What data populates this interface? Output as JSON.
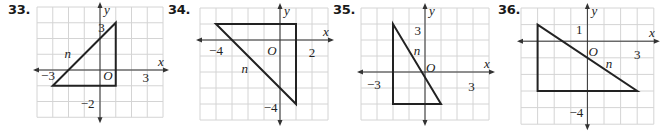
{
  "colors": {
    "grid": "#d4d4d4",
    "axis": "#333333",
    "triangle": "#222222",
    "text": "#222222"
  },
  "problems": [
    {
      "number": "33.",
      "num_x": 8,
      "grid": {
        "left": 37,
        "top": 7,
        "cell": 15.75,
        "xmin": -4,
        "xmax": 4,
        "ymin": -3,
        "ymax": 4
      },
      "triangle": [
        [
          -3,
          -1
        ],
        [
          1,
          -1
        ],
        [
          1,
          3
        ]
      ],
      "hypotenuse_label": {
        "text": "n",
        "x": -2.05,
        "y": 1.0
      },
      "axis_labels": {
        "x": "x",
        "y": "y",
        "origin": "O"
      },
      "ticks": [
        {
          "text": "3",
          "x": 0.3,
          "y": 2.7,
          "anchor": "end"
        },
        {
          "text": "−3",
          "x": -3.3,
          "y": -0.3,
          "anchor": "middle"
        },
        {
          "text": "3",
          "x": 2.9,
          "y": -0.45,
          "anchor": "middle"
        },
        {
          "text": "−2",
          "x": -0.35,
          "y": -2.1,
          "anchor": "end"
        }
      ],
      "origin_pos": {
        "x": 0.5,
        "y": -0.3
      }
    },
    {
      "number": "34.",
      "num_x": 168,
      "grid": {
        "left": 200,
        "top": 8,
        "cell": 16,
        "xmin": -5,
        "xmax": 3,
        "ymin": -5,
        "ymax": 2
      },
      "triangle": [
        [
          -4,
          1
        ],
        [
          1,
          1
        ],
        [
          1,
          -4
        ]
      ],
      "hypotenuse_label": {
        "text": "n",
        "x": -2.2,
        "y": -1.8
      },
      "axis_labels": {
        "x": "x",
        "y": "y",
        "origin": "O"
      },
      "ticks": [
        {
          "text": "−4",
          "x": -4.0,
          "y": -0.6,
          "anchor": "middle"
        },
        {
          "text": "2",
          "x": 2.0,
          "y": -0.75,
          "anchor": "middle"
        },
        {
          "text": "−4",
          "x": -0.15,
          "y": -4.2,
          "anchor": "end"
        }
      ],
      "origin_pos": {
        "x": -0.5,
        "y": -0.6
      }
    },
    {
      "number": "35.",
      "num_x": 333,
      "grid": {
        "left": 361,
        "top": 8,
        "cell": 16,
        "xmin": -4,
        "xmax": 4,
        "ymin": -3,
        "ymax": 4
      },
      "triangle": [
        [
          -2,
          3
        ],
        [
          -2,
          -2
        ],
        [
          1,
          -2
        ]
      ],
      "hypotenuse_label": {
        "text": "n",
        "x": -0.5,
        "y": 1.3
      },
      "axis_labels": {
        "x": "x",
        "y": "y",
        "origin": "O"
      },
      "ticks": [
        {
          "text": "3",
          "x": -0.25,
          "y": 2.6,
          "anchor": "end"
        },
        {
          "text": "−3",
          "x": -3.2,
          "y": -0.75,
          "anchor": "middle"
        },
        {
          "text": "3",
          "x": 2.9,
          "y": -0.85,
          "anchor": "middle"
        }
      ],
      "origin_pos": {
        "x": 0.35,
        "y": 0.3
      }
    },
    {
      "number": "36.",
      "num_x": 498,
      "grid": {
        "left": 521,
        "top": 8,
        "cell": 16.6,
        "xmin": -4,
        "xmax": 4,
        "ymin": -5,
        "ymax": 2
      },
      "triangle": [
        [
          -3,
          1
        ],
        [
          -3,
          -3
        ],
        [
          3,
          -3
        ]
      ],
      "hypotenuse_label": {
        "text": "n",
        "x": 1.3,
        "y": -1.35
      },
      "axis_labels": {
        "x": "x",
        "y": "y",
        "origin": "O"
      },
      "ticks": [
        {
          "text": "1",
          "x": -0.3,
          "y": 0.75,
          "anchor": "end"
        },
        {
          "text": "3",
          "x": 3.0,
          "y": -0.75,
          "anchor": "middle"
        },
        {
          "text": "−4",
          "x": -0.25,
          "y": -4.25,
          "anchor": "end"
        }
      ],
      "origin_pos": {
        "x": 0.35,
        "y": -0.6
      }
    }
  ]
}
